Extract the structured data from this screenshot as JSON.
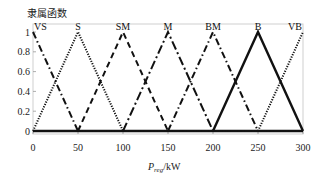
{
  "chart_data": {
    "type": "line",
    "title": "隶属函数",
    "xlabel": "P_reg/kW",
    "xlabel_main": "P",
    "xlabel_sub": "reg",
    "xlabel_unit": "/kW",
    "ylabel": "隶属函数",
    "xlim": [
      0,
      300
    ],
    "ylim": [
      0,
      1
    ],
    "x_ticks": [
      0,
      50,
      100,
      150,
      200,
      250,
      300
    ],
    "y_ticks": [
      0,
      0.2,
      0.4,
      0.6,
      0.8,
      1
    ],
    "y_tick_labels": [
      "0",
      "0.2",
      "0.4",
      "0.6",
      "0.8",
      "1"
    ],
    "grid": false,
    "legend": "inline labels at peaks",
    "series": [
      {
        "name": "VS",
        "x": [
          0,
          50,
          300
        ],
        "values": [
          1,
          0,
          0
        ],
        "style": "dashdot"
      },
      {
        "name": "S",
        "x": [
          0,
          50,
          100
        ],
        "values": [
          0,
          1,
          0
        ],
        "style": "dotted"
      },
      {
        "name": "SM",
        "x": [
          50,
          100,
          150
        ],
        "values": [
          0,
          1,
          0
        ],
        "style": "dashed"
      },
      {
        "name": "M",
        "x": [
          100,
          150,
          200
        ],
        "values": [
          0,
          1,
          0
        ],
        "style": "longdashdot"
      },
      {
        "name": "BM",
        "x": [
          150,
          200,
          250
        ],
        "values": [
          0,
          1,
          0
        ],
        "style": "dashdot"
      },
      {
        "name": "B",
        "x": [
          200,
          250,
          300
        ],
        "values": [
          0,
          1,
          0
        ],
        "style": "solid"
      },
      {
        "name": "VB",
        "x": [
          250,
          300
        ],
        "values": [
          0,
          1
        ],
        "style": "dotted"
      }
    ]
  }
}
